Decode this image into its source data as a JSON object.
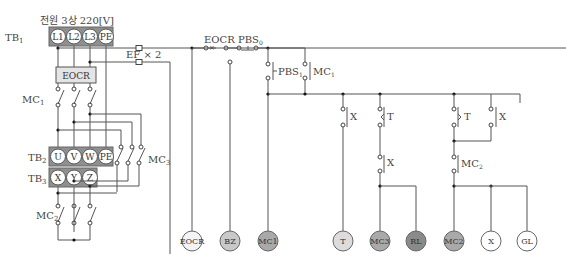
{
  "diagram": {
    "type": "electrical-sequence-control-circuit",
    "power_label": "전원 3상 220[V]",
    "terminal_blocks": [
      {
        "id": "TB1",
        "label": "TB",
        "sub": "1",
        "terminals": [
          "L1",
          "L2",
          "L3",
          "PE"
        ]
      },
      {
        "id": "TB2",
        "label": "TB",
        "sub": "2",
        "terminals": [
          "U",
          "V",
          "W",
          "PE"
        ]
      },
      {
        "id": "TB3",
        "label": "TB",
        "sub": "3",
        "terminals": [
          "X",
          "Y",
          "Z"
        ]
      }
    ],
    "power_circuit": {
      "eocr_label": "EOCR",
      "contactors": [
        {
          "label": "MC",
          "sub": "1"
        },
        {
          "label": "MC",
          "sub": "3"
        },
        {
          "label": "MC",
          "sub": "2"
        }
      ],
      "fuse_label": "EF × 2"
    },
    "control_circuit": {
      "top_contacts": [
        {
          "label": "EOCR",
          "type": "nc-thermal"
        },
        {
          "label": "PBS",
          "sub": "0",
          "type": "nc-pushbutton"
        }
      ],
      "parallel_contacts": [
        {
          "label": "PBS",
          "sub": "1",
          "type": "no-pushbutton"
        },
        {
          "label": "MC",
          "sub": "1",
          "type": "no"
        }
      ],
      "branch_contacts": [
        {
          "label": "X",
          "type": "no"
        },
        {
          "label": "T",
          "type": "timer-no"
        },
        {
          "label": "X",
          "type": "nc"
        },
        {
          "label": "T",
          "type": "timer-no"
        },
        {
          "label": "X",
          "type": "no"
        },
        {
          "label": "MC",
          "sub": "2",
          "type": "nc"
        }
      ],
      "loads": [
        {
          "label": "EOCR",
          "fill": "#f4f4f4"
        },
        {
          "label": "BZ",
          "fill": "#c9c9c9"
        },
        {
          "label": "MC1",
          "fill": "#a9a9a9"
        },
        {
          "label": "T",
          "fill": "#dcdcdc"
        },
        {
          "label": "MC3",
          "fill": "#a9a9a9"
        },
        {
          "label": "RL",
          "fill": "#8a8a8a"
        },
        {
          "label": "MC2",
          "fill": "#a9a9a9"
        },
        {
          "label": "X",
          "fill": "#ffffff"
        },
        {
          "label": "GL",
          "fill": "#ffffff"
        }
      ]
    }
  }
}
